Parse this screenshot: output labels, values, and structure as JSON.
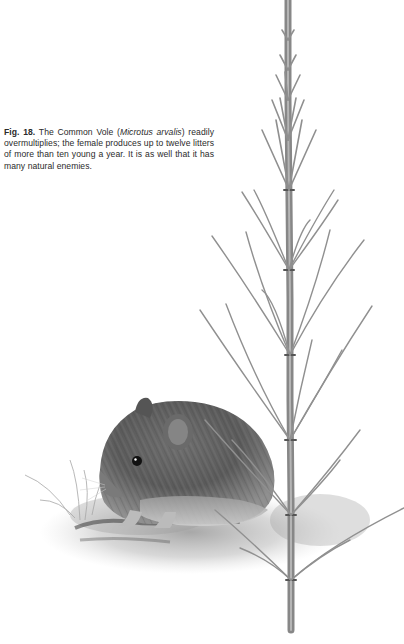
{
  "caption": {
    "figure_label": "Fig. 18.",
    "text_before_latin": " The Common Vole (",
    "latin_name": "Microtus arvalis",
    "text_after_latin": ") readily overmultiplies; the female produces up to twelve litters of more than ten young a year. It is as well that it has many natural enemies."
  },
  "illustration": {
    "subject": "Common vole sitting beside a horsetail plant",
    "style": "graphite pencil drawing",
    "colors": {
      "fur_dark": "#4a4a4a",
      "fur_mid": "#7a7a7a",
      "fur_light": "#b5b5b5",
      "stem": "#8c8c8c",
      "ground": "#9a9a9a"
    }
  }
}
